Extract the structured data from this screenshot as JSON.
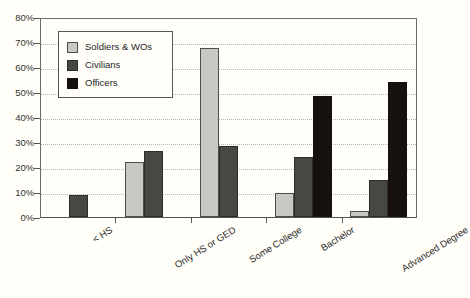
{
  "chart_data": {
    "type": "bar",
    "title": "",
    "subtitle": "",
    "xlabel": "",
    "ylabel": "",
    "ylim": [
      0,
      80
    ],
    "ytick_labels": [
      "0%",
      "10%",
      "20%",
      "30%",
      "40%",
      "50%",
      "60%",
      "70%",
      "80%"
    ],
    "ytick_values": [
      0,
      10,
      20,
      30,
      40,
      50,
      60,
      70,
      80
    ],
    "grid": true,
    "legend_position": "upper-left-inside",
    "categories": [
      "< HS",
      "Only HS or GED",
      "Some College",
      "Bachelor",
      "Advanced Degree"
    ],
    "series": [
      {
        "name": "Soldiers & WOs",
        "color": "#c9c9c4",
        "values": [
          0,
          22,
          67.5,
          9.5,
          2.5
        ]
      },
      {
        "name": "Civilians",
        "color": "#474744",
        "values": [
          9,
          26.5,
          28.5,
          24,
          15
        ]
      },
      {
        "name": "Officers",
        "color": "#17110e",
        "values": [
          0,
          0,
          0,
          48.5,
          54
        ]
      }
    ]
  }
}
